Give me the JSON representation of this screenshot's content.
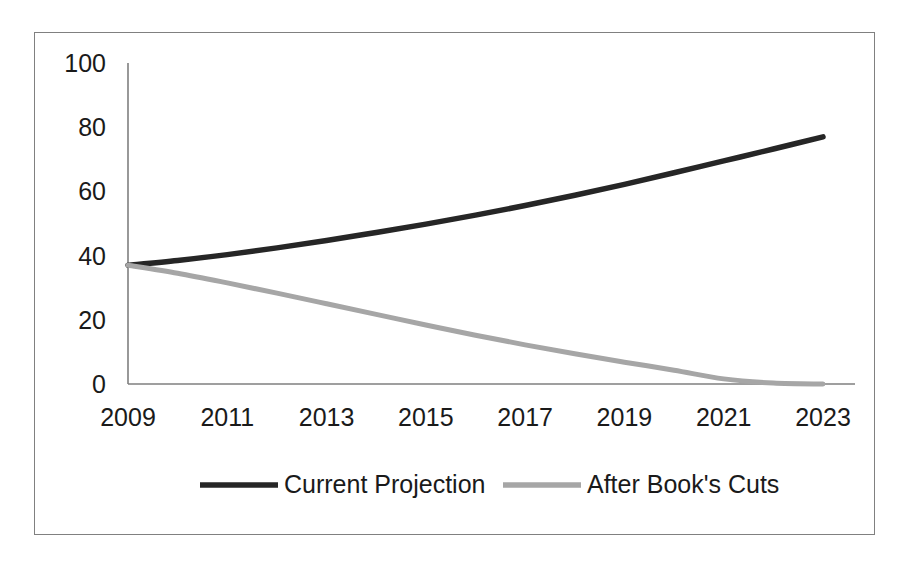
{
  "chart_data": {
    "type": "line",
    "title": "",
    "xlabel": "",
    "ylabel": "",
    "xlim": [
      2009,
      2023
    ],
    "ylim": [
      0,
      100
    ],
    "grid": false,
    "legend_position": "bottom",
    "x": [
      2009,
      2010,
      2011,
      2012,
      2013,
      2014,
      2015,
      2016,
      2017,
      2018,
      2019,
      2020,
      2021,
      2022,
      2023
    ],
    "xtick_labels": [
      "2009",
      "2011",
      "2013",
      "2015",
      "2017",
      "2019",
      "2021",
      "2023"
    ],
    "xtick_values": [
      2009,
      2011,
      2013,
      2015,
      2017,
      2019,
      2021,
      2023
    ],
    "ytick_labels": [
      "100",
      "80",
      "60",
      "40",
      "20",
      "0"
    ],
    "ytick_values": [
      100,
      80,
      60,
      40,
      20,
      0
    ],
    "series": [
      {
        "name": "Current Projection",
        "color": "#262626",
        "values": [
          37,
          38.5,
          40.3,
          42.4,
          44.7,
          47.2,
          49.8,
          52.6,
          55.6,
          58.8,
          62.2,
          65.8,
          69.5,
          73.2,
          77
        ]
      },
      {
        "name": "After Book's Cuts",
        "color": "#a6a6a6",
        "values": [
          37,
          34.5,
          31.5,
          28.3,
          25.0,
          21.7,
          18.4,
          15.2,
          12.2,
          9.4,
          6.8,
          4.3,
          1.6,
          0.3,
          0
        ]
      }
    ]
  },
  "legend": {
    "entries": [
      {
        "label": "Current Projection",
        "color": "#262626"
      },
      {
        "label": "After Book's Cuts",
        "color": "#a6a6a6"
      }
    ]
  },
  "colors": {
    "frame_border": "#808080",
    "axis": "#7f7f7f",
    "text": "#1a1a1a",
    "series_dark": "#262626",
    "series_light": "#a6a6a6",
    "background": "#ffffff"
  }
}
